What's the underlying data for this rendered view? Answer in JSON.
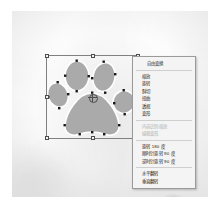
{
  "app": {
    "document_title": "",
    "canvas_label": "image-canvas"
  },
  "selection": {
    "label": "transform-selection-box",
    "x": 46,
    "y": 55,
    "width": 93,
    "height": 84,
    "handle_count": 8,
    "pivot_label": "transform-pivot-point"
  },
  "artwork": {
    "name": "paw-print-shape",
    "fill_color": "#aaaaaa",
    "stroke_color": "#ffffff",
    "anchor_point_color": "#1a1a1a"
  },
  "context_menu": {
    "name": "transform-context-menu",
    "groups": [
      {
        "items": [
          {
            "label": "自由变换",
            "enabled": true,
            "name": "menu-item-free-transform"
          }
        ]
      },
      {
        "items": [
          {
            "label": "缩放",
            "enabled": true,
            "name": "menu-item-scale"
          },
          {
            "label": "旋转",
            "enabled": true,
            "name": "menu-item-rotate"
          },
          {
            "label": "斜切",
            "enabled": true,
            "name": "menu-item-skew"
          },
          {
            "label": "扭曲",
            "enabled": true,
            "name": "menu-item-distort"
          },
          {
            "label": "透视",
            "enabled": true,
            "name": "menu-item-perspective"
          },
          {
            "label": "变形",
            "enabled": true,
            "name": "menu-item-warp"
          }
        ]
      },
      {
        "items": [
          {
            "label": "内容识别缩放",
            "enabled": false,
            "name": "menu-item-content-aware-scale"
          },
          {
            "label": "编辑变形",
            "enabled": false,
            "name": "menu-item-edit-warp"
          }
        ]
      },
      {
        "items": [
          {
            "label": "旋转 180 度",
            "enabled": true,
            "name": "menu-item-rotate-180"
          },
          {
            "label": "顺时针旋转 90 度",
            "enabled": true,
            "name": "menu-item-rotate-cw-90"
          },
          {
            "label": "逆时针旋转 90 度",
            "enabled": true,
            "name": "menu-item-rotate-ccw-90"
          }
        ]
      },
      {
        "items": [
          {
            "label": "水平翻转",
            "enabled": true,
            "name": "menu-item-flip-horizontal"
          },
          {
            "label": "垂直翻转",
            "enabled": true,
            "name": "menu-item-flip-vertical"
          }
        ]
      }
    ]
  },
  "colors": {
    "menu_background": "#f4f4f4",
    "menu_border": "#9a9a9a",
    "menu_text": "#1c1c1c",
    "menu_text_disabled": "#b0b0b0",
    "selection_border": "#808080",
    "handle_fill": "#f2f2f2",
    "handle_border": "#4d4d4d"
  }
}
